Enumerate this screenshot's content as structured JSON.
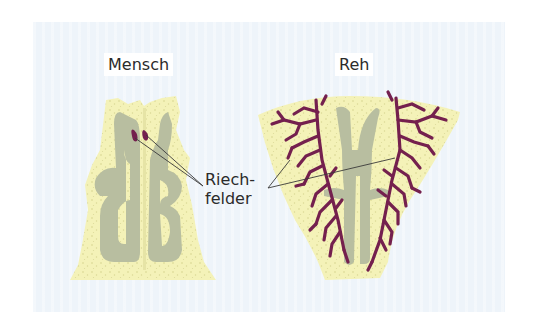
{
  "figure": {
    "labels": {
      "human": "Mensch",
      "deer": "Reh",
      "olfactory_line1": "Riech-",
      "olfactory_line2": "felder"
    },
    "colors": {
      "background_panel": "#eef4fa",
      "tissue": "#f4f2b8",
      "concha": "#b8bea0",
      "olfactory_field": "#74204e",
      "leader_line": "#3a3a3a",
      "text": "#2b2b2b"
    }
  }
}
